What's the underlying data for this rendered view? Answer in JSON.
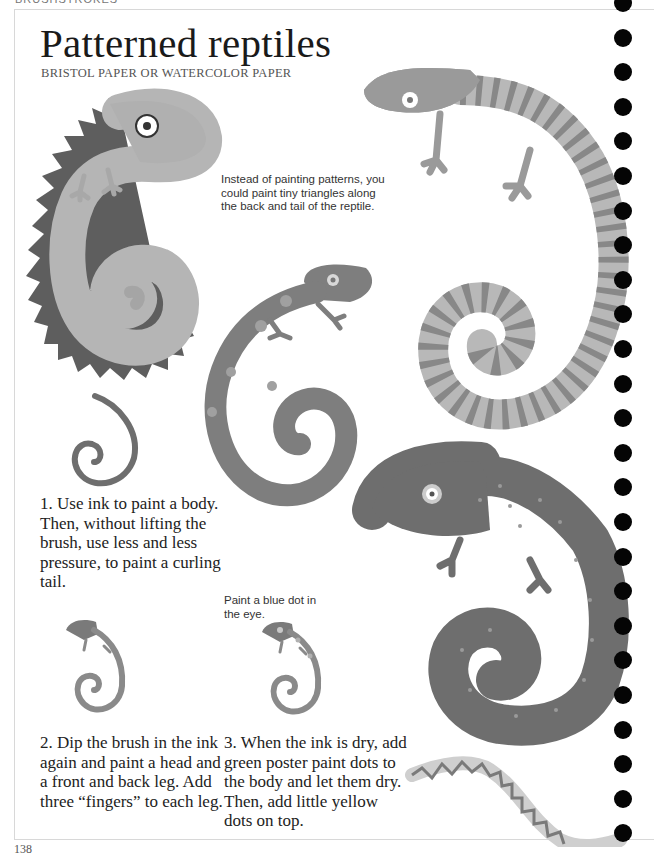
{
  "page": {
    "section_header": "BRUSHSTROKES",
    "page_number": "138",
    "title": "Patterned reptiles",
    "subtitle": "BRISTOL PAPER OR WATERCOLOR PAPER"
  },
  "notes": {
    "triangles_tip": "Instead of painting patterns, you could paint tiny triangles along the back and tail of the reptile.",
    "eye_tip": "Paint a blue dot in the eye."
  },
  "steps": [
    {
      "number": "1.",
      "text": "1. Use ink to paint a body. Then, without lifting the brush, use less and less pressure, to paint a curling tail."
    },
    {
      "number": "2.",
      "text": "2. Dip the brush in the ink again and paint a head and a front and back leg. Add three “fingers” to each leg."
    },
    {
      "number": "3.",
      "text": "3. When the ink is dry, add green poster paint dots to the body and let them dry. Then, add little yellow dots on top."
    }
  ],
  "illustrations": [
    {
      "name": "spiky-lizard",
      "description": "Light lizard with triangles along back and tail"
    },
    {
      "name": "striped-lizard",
      "description": "Lizard with striped body and spiral tail"
    },
    {
      "name": "spotted-lizard",
      "description": "Lizard with light spots and spiral tail"
    },
    {
      "name": "dotted-chameleon",
      "description": "Dark chameleon with small dots and curled tail"
    },
    {
      "name": "step1-tail",
      "description": "Ink body with curling tail"
    },
    {
      "name": "step2-lizard",
      "description": "Body with head and legs"
    },
    {
      "name": "step3-lizard",
      "description": "Lizard with dots and blue eye dot"
    },
    {
      "name": "zigzag-snake",
      "description": "Snake with zigzag pattern"
    }
  ],
  "colors": {
    "ink_light": "#a9a9a9",
    "ink_mid": "#8f8f8f",
    "ink_dark": "#6e6e6e",
    "spikes": "#5e5e5e",
    "binding": "#050505"
  },
  "binding": {
    "hole_count": 25
  }
}
